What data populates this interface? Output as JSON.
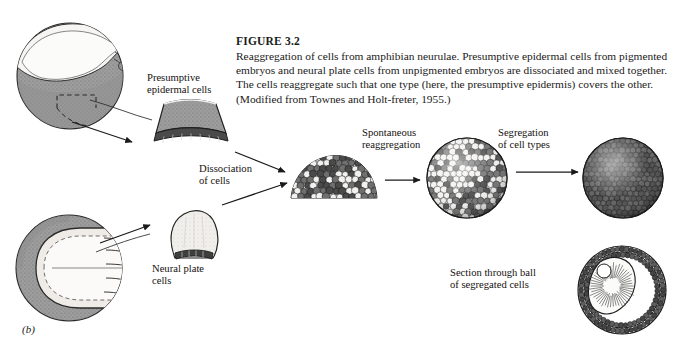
{
  "figure": {
    "number": "FIGURE 3.2",
    "caption": "Reaggregation of cells from amphibian neurulae. Presumptive epidermal cells from pigmented embryos and neural plate cells from unpigmented embryos are dissociated and mixed together. The cells reaggregate such that one type (here, the presumptive epidermis) covers the other. (Modified from Townes and Holt-freter, 1955.)",
    "panel_letter": "(b)"
  },
  "labels": {
    "presumptive_epidermal_cells": "Presumptive\nepidermal cells",
    "dissociation_of_cells": "Dissociation\nof cells",
    "spontaneous_reaggregation": "Spontaneous\nreaggregation",
    "segregation_of_cell_types": "Segregation\nof cell types",
    "neural_plate_cells": "Neural plate\ncells",
    "section_through_ball": "Section through ball\nof segregated cells"
  },
  "colors": {
    "ink": "#1a1a1a",
    "pigmented_gray": "#9a9a9a",
    "pigmented_dark": "#5d5d5d",
    "unpigmented_light": "#f2f1ef",
    "mid_gray": "#b8b8b8",
    "paper": "#ffffff"
  },
  "stages": [
    {
      "name": "pigmented-embryo-neurula",
      "type": "embryo-lateral-view",
      "description": "Pigmented amphibian neurula, lateral view, with dashed excision box marking presumptive epidermis"
    },
    {
      "name": "presumptive-epidermis-explant",
      "type": "explant-wedge",
      "description": "Curved wedge of pigmented presumptive epidermal tissue with dark cell layer"
    },
    {
      "name": "unpigmented-embryo-neurula",
      "type": "embryo-dorsal-view",
      "description": "Unpigmented amphibian neurula, dorsal view, with dashed outline of neural plate"
    },
    {
      "name": "neural-plate-explant",
      "type": "explant-dome",
      "description": "Pale dome-shaped explant of neural plate tissue"
    },
    {
      "name": "dissociated-cell-mound",
      "type": "cell-mound",
      "description": "Mound of dissociated, randomly mixed light and dark cells"
    },
    {
      "name": "reaggregated-sphere-mixed",
      "type": "sphere-mixed",
      "description": "Sphere of reaggregated cells with light and dark cells still intermixed on the surface"
    },
    {
      "name": "segregated-sphere-dark",
      "type": "sphere-uniform",
      "description": "Sphere whose entire surface is covered by dark pigmented epidermal cells"
    },
    {
      "name": "segregated-sphere-section",
      "type": "sphere-cross-section",
      "description": "Cross section showing dark epidermal shell enclosing an inner mass of pale neural cells"
    }
  ],
  "arrows": [
    {
      "name": "embryo-to-epidermis-explant",
      "from": "pigmented-embryo-neurula",
      "to": "presumptive-epidermis-explant"
    },
    {
      "name": "epidermis-explant-to-mound",
      "from": "presumptive-epidermis-explant",
      "to": "dissociated-cell-mound"
    },
    {
      "name": "embryo-to-neural-explant",
      "from": "unpigmented-embryo-neurula",
      "to": "neural-plate-explant"
    },
    {
      "name": "neural-explant-to-mound",
      "from": "neural-plate-explant",
      "to": "dissociated-cell-mound"
    },
    {
      "name": "mound-to-reaggregate",
      "from": "dissociated-cell-mound",
      "to": "reaggregated-sphere-mixed"
    },
    {
      "name": "reaggregate-to-segregated",
      "from": "reaggregated-sphere-mixed",
      "to": "segregated-sphere-dark"
    }
  ]
}
